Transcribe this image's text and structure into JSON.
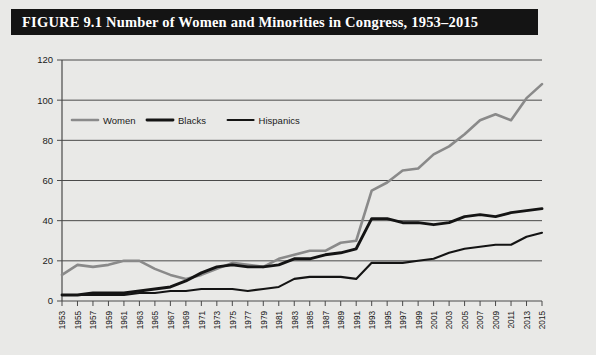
{
  "figure": {
    "label": "FIGURE",
    "number": "9.1",
    "title": "Number of Women and Minorities in Congress, 1953–2015",
    "full_title": "FIGURE 9.1 Number of Women and Minorities in Congress, 1953–2015",
    "title_bar_color": "#141414",
    "title_text_color": "#ffffff",
    "background_color": "#e9e9e7"
  },
  "chart_data": {
    "type": "line",
    "title": "Number of Women and Minorities in Congress, 1953–2015",
    "xlabel": "",
    "ylabel": "",
    "ylim": [
      0,
      120
    ],
    "ytick_step": 20,
    "yticks": [
      "0",
      "20",
      "40",
      "60",
      "80",
      "100",
      "120"
    ],
    "grid": true,
    "grid_axis": "y",
    "legend_position": "top-left-inside",
    "categories": [
      "1953",
      "1955",
      "1957",
      "1959",
      "1961",
      "1963",
      "1965",
      "1967",
      "1969",
      "1971",
      "1973",
      "1975",
      "1977",
      "1979",
      "1981",
      "1983",
      "1985",
      "1987",
      "1989",
      "1991",
      "1993",
      "1995",
      "1997",
      "1999",
      "2001",
      "2003",
      "2005",
      "2007",
      "2009",
      "2011",
      "2013",
      "2015"
    ],
    "series": [
      {
        "name": "Women",
        "color": "#8a8a8a",
        "stroke_width": 2.6,
        "values": [
          13,
          18,
          17,
          18,
          20,
          20,
          16,
          13,
          11,
          13,
          16,
          19,
          18,
          17,
          21,
          23,
          25,
          25,
          29,
          30,
          55,
          59,
          65,
          66,
          73,
          77,
          83,
          90,
          93,
          90,
          101,
          108
        ]
      },
      {
        "name": "Blacks",
        "color": "#141414",
        "stroke_width": 2.9,
        "values": [
          3,
          3,
          4,
          4,
          4,
          5,
          6,
          7,
          10,
          14,
          17,
          18,
          17,
          17,
          18,
          21,
          21,
          23,
          24,
          26,
          41,
          41,
          39,
          39,
          38,
          39,
          42,
          43,
          42,
          44,
          45,
          46
        ]
      },
      {
        "name": "Hispanics",
        "color": "#141414",
        "stroke_width": 2.1,
        "values": [
          3,
          3,
          3,
          3,
          3,
          4,
          4,
          5,
          5,
          6,
          6,
          6,
          5,
          6,
          7,
          11,
          12,
          12,
          12,
          11,
          19,
          19,
          19,
          20,
          21,
          24,
          26,
          27,
          28,
          28,
          32,
          34
        ]
      }
    ]
  }
}
